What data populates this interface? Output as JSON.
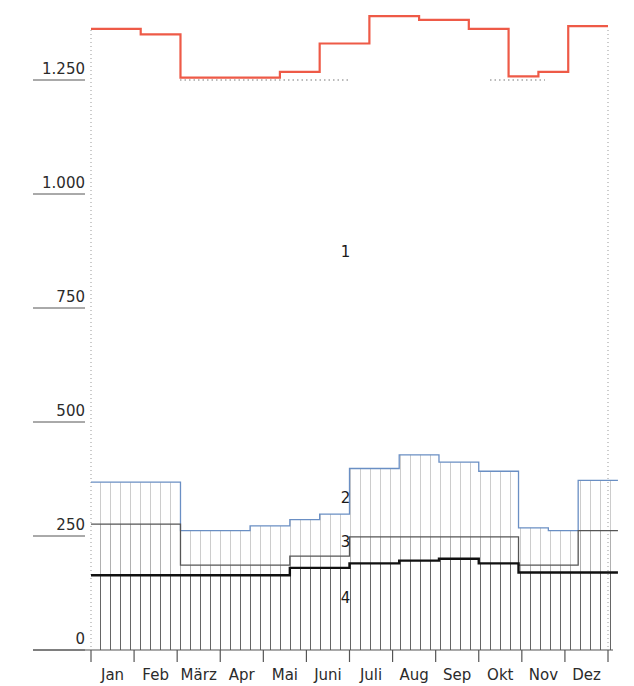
{
  "chart_data": {
    "type": "line",
    "title": "",
    "subtitle": "",
    "xlabel": "",
    "ylabel": "",
    "xlim": [
      0,
      52
    ],
    "ylim": [
      0,
      1400
    ],
    "grid": false,
    "legend_position": "inline-annotations",
    "y_ticks": [
      "0",
      "250",
      "500",
      "750",
      "1.000",
      "1.250"
    ],
    "y_tick_values": [
      0,
      250,
      500,
      750,
      1000,
      1250
    ],
    "x_tick_labels": [
      "Jan",
      "Feb",
      "März",
      "Apr",
      "Mai",
      "Juni",
      "Juli",
      "Aug",
      "Sep",
      "Okt",
      "Nov",
      "Dez"
    ],
    "reference_line": {
      "value": 1250,
      "style": "dotted",
      "color": "#777777"
    },
    "colors": {
      "series1": "#ee5a47",
      "series2": "#6a8fc4",
      "series3": "#555555",
      "series4": "#111111",
      "hatch": "#8f8f8f",
      "axis": "#555555",
      "dotted_border": "#999999"
    },
    "annotations": [
      {
        "text": "1",
        "x_week": 25.6,
        "y_value": 862
      },
      {
        "text": "2",
        "x_week": 25.6,
        "y_value": 322
      },
      {
        "text": "3",
        "x_week": 25.6,
        "y_value": 226
      },
      {
        "text": "4",
        "x_week": 25.6,
        "y_value": 102
      }
    ],
    "series": [
      {
        "name": "1",
        "label": "1",
        "style": "step-line",
        "color": "#ee5a47",
        "values": [
          1362,
          1362,
          1362,
          1362,
          1362,
          1350,
          1350,
          1350,
          1350,
          1255,
          1255,
          1255,
          1255,
          1255,
          1255,
          1255,
          1255,
          1255,
          1255,
          1268,
          1268,
          1268,
          1268,
          1330,
          1330,
          1330,
          1330,
          1330,
          1390,
          1390,
          1390,
          1390,
          1390,
          1382,
          1382,
          1382,
          1382,
          1382,
          1362,
          1362,
          1362,
          1362,
          1258,
          1258,
          1258,
          1268,
          1268,
          1268,
          1368,
          1368,
          1368,
          1368
        ]
      },
      {
        "name": "2",
        "label": "2",
        "style": "step-area-hatched",
        "color": "#6a8fc4",
        "values": [
          368,
          368,
          368,
          368,
          368,
          368,
          368,
          368,
          368,
          262,
          262,
          262,
          262,
          262,
          262,
          262,
          272,
          272,
          272,
          272,
          286,
          286,
          286,
          298,
          298,
          298,
          398,
          398,
          398,
          398,
          398,
          428,
          428,
          428,
          428,
          412,
          412,
          412,
          412,
          392,
          392,
          392,
          392,
          268,
          268,
          268,
          262,
          262,
          262,
          372,
          372,
          372,
          372
        ]
      },
      {
        "name": "3",
        "label": "3",
        "style": "step-area-hatched",
        "color": "#555555",
        "values": [
          276,
          276,
          276,
          276,
          276,
          276,
          276,
          276,
          276,
          186,
          186,
          186,
          186,
          186,
          186,
          186,
          186,
          186,
          186,
          186,
          206,
          206,
          206,
          206,
          206,
          206,
          248,
          248,
          248,
          248,
          248,
          248,
          248,
          248,
          248,
          248,
          248,
          248,
          248,
          248,
          248,
          248,
          248,
          186,
          186,
          186,
          186,
          186,
          186,
          262,
          262,
          262,
          262
        ]
      },
      {
        "name": "4",
        "label": "4",
        "style": "step-area-hatched-bold",
        "color": "#111111",
        "values": [
          164,
          164,
          164,
          164,
          164,
          164,
          164,
          164,
          164,
          164,
          164,
          164,
          164,
          164,
          164,
          164,
          164,
          164,
          164,
          164,
          180,
          180,
          180,
          180,
          180,
          180,
          190,
          190,
          190,
          190,
          190,
          196,
          196,
          196,
          196,
          200,
          200,
          200,
          200,
          190,
          190,
          190,
          190,
          170,
          170,
          170,
          170,
          170,
          170,
          170,
          170,
          170,
          170
        ]
      }
    ]
  }
}
